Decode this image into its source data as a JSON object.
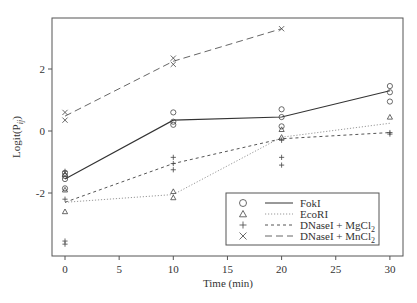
{
  "chart_data": {
    "type": "line",
    "title": "",
    "xlabel": "Time (min)",
    "ylabel": "Logit(P_ij)",
    "xlim": [
      -2.4,
      30.6
    ],
    "ylim": [
      -4.05,
      3.65
    ],
    "xticks": [
      0,
      5,
      10,
      15,
      20,
      25,
      30
    ],
    "yticks": [
      -2,
      0,
      2
    ],
    "grid": false,
    "legend_position": "lower right",
    "series": [
      {
        "name": "FokI",
        "marker": "circle",
        "line_style": "solid",
        "x": [
          0,
          10,
          20,
          30
        ],
        "mean_values": [
          -1.55,
          0.35,
          0.45,
          1.3
        ],
        "points": [
          [
            0,
            -1.35
          ],
          [
            0,
            -1.45
          ],
          [
            0,
            -1.55
          ],
          [
            0,
            -1.85
          ],
          [
            10,
            0.6
          ],
          [
            10,
            0.3
          ],
          [
            10,
            0.2
          ],
          [
            20,
            0.7
          ],
          [
            20,
            0.45
          ],
          [
            20,
            0.15
          ],
          [
            30,
            1.45
          ],
          [
            30,
            1.25
          ],
          [
            30,
            0.95
          ]
        ]
      },
      {
        "name": "EcoRI",
        "marker": "triangle",
        "line_style": "dotted",
        "x": [
          0,
          10,
          20,
          30
        ],
        "mean_values": [
          -2.3,
          -2.05,
          -0.2,
          0.25
        ],
        "points": [
          [
            0,
            -1.4
          ],
          [
            0,
            -1.9
          ],
          [
            0,
            -2.6
          ],
          [
            10,
            -1.95
          ],
          [
            10,
            -2.15
          ],
          [
            20,
            0.05
          ],
          [
            20,
            -0.2
          ],
          [
            30,
            0.45
          ]
        ]
      },
      {
        "name": "DNaseI + MgCl2",
        "marker": "plus",
        "line_style": "dashed",
        "x": [
          0,
          10,
          20,
          30
        ],
        "mean_values": [
          -2.3,
          -1.05,
          -0.25,
          -0.05
        ],
        "points": [
          [
            0,
            -1.3
          ],
          [
            0,
            -2.2
          ],
          [
            0,
            -3.55
          ],
          [
            0,
            -3.65
          ],
          [
            10,
            -0.85
          ],
          [
            10,
            -1.05
          ],
          [
            10,
            -1.25
          ],
          [
            20,
            -0.3
          ],
          [
            20,
            -0.85
          ],
          [
            20,
            -1.1
          ],
          [
            30,
            -0.05
          ],
          [
            30,
            -0.1
          ]
        ]
      },
      {
        "name": "DNaseI + MnCl2",
        "marker": "x",
        "line_style": "long-dashed",
        "x": [
          0,
          10,
          20
        ],
        "mean_values": [
          0.48,
          2.25,
          3.3
        ],
        "points": [
          [
            0,
            0.6
          ],
          [
            0,
            0.35
          ],
          [
            10,
            2.35
          ],
          [
            10,
            2.15
          ],
          [
            20,
            3.3
          ]
        ]
      }
    ]
  },
  "axes": {
    "xlabel": "Time (min)",
    "ylabel_main": "Logit(P",
    "ylabel_sub": "ij",
    "ylabel_close": ")",
    "xtick_labels": [
      "0",
      "5",
      "10",
      "15",
      "20",
      "25",
      "30"
    ],
    "ytick_labels": [
      "-2",
      "0",
      "2"
    ]
  },
  "legend": {
    "items": [
      {
        "label": "FokI",
        "sub": ""
      },
      {
        "label": "EcoRI",
        "sub": ""
      },
      {
        "label": "DNaseI + MgCl",
        "sub": "2"
      },
      {
        "label": "DNaseI + MnCl",
        "sub": "2"
      }
    ]
  }
}
